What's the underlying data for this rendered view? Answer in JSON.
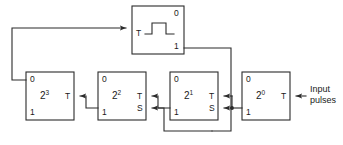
{
  "figure": {
    "type": "logic-circuit-diagram",
    "stroke_color": "#2b2b2b",
    "background_color": "#ffffff",
    "text_color": "#1a1a1a"
  },
  "blocks": [
    {
      "id": "pulse-source",
      "symbol": "pulse-waveform",
      "top_label": "0",
      "bottom_label": "1",
      "input_pin": "T",
      "x": 132,
      "y": 6,
      "w": 52,
      "h": 48
    },
    {
      "id": "stage-8",
      "weight": "2",
      "exponent": "3",
      "top_label": "0",
      "bottom_label": "1",
      "pins": [
        "T"
      ],
      "x": 26,
      "y": 72,
      "w": 48,
      "h": 48
    },
    {
      "id": "stage-4",
      "weight": "2",
      "exponent": "2",
      "top_label": "0",
      "bottom_label": "1",
      "pins": [
        "T",
        "S"
      ],
      "x": 98,
      "y": 72,
      "w": 48,
      "h": 48
    },
    {
      "id": "stage-2",
      "weight": "2",
      "exponent": "1",
      "top_label": "0",
      "bottom_label": "1",
      "pins": [
        "T",
        "S"
      ],
      "x": 170,
      "y": 72,
      "w": 48,
      "h": 48
    },
    {
      "id": "stage-1",
      "weight": "2",
      "exponent": "0",
      "top_label": "0",
      "bottom_label": "1",
      "pins": [
        "T"
      ],
      "x": 242,
      "y": 72,
      "w": 48,
      "h": 48
    }
  ],
  "annotations": {
    "input_line1": "Input",
    "input_line2": "pulses"
  },
  "pin_labels": {
    "t": "T",
    "s": "S",
    "zero": "0",
    "one": "1"
  }
}
